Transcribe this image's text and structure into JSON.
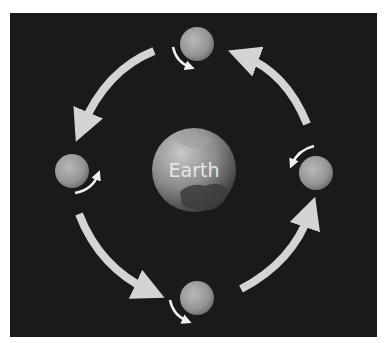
{
  "diagram": {
    "center_label": "Earth",
    "colors": {
      "background": "#1a1a1a",
      "page": "#ffffff",
      "orbit_arrow": "#d4d4d4",
      "rotation_arrow": "#f0f0f0",
      "moon": "#9a9a9a",
      "earth": "#808080"
    },
    "moons": [
      {
        "position": "top",
        "cx": 197,
        "cy": 44,
        "r": 17
      },
      {
        "position": "left",
        "cx": 72,
        "cy": 171,
        "r": 17
      },
      {
        "position": "right",
        "cx": 316,
        "cy": 173,
        "r": 17
      },
      {
        "position": "bottom",
        "cx": 197,
        "cy": 298,
        "r": 17
      }
    ],
    "orbit_arrows": [
      {
        "segment": "top-to-left",
        "direction": "counterclockwise"
      },
      {
        "segment": "left-to-bottom",
        "direction": "counterclockwise"
      },
      {
        "segment": "bottom-to-right",
        "direction": "counterclockwise"
      },
      {
        "segment": "right-to-top",
        "direction": "counterclockwise"
      }
    ]
  }
}
